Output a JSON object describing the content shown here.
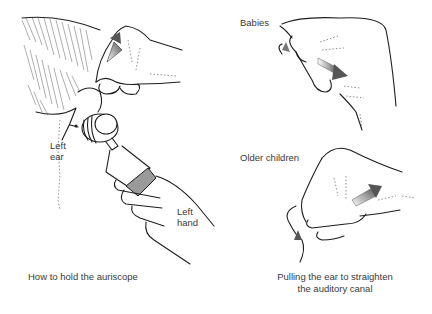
{
  "figure": {
    "left_panel": {
      "labels": {
        "ear": [
          "Left",
          "ear"
        ],
        "hand": [
          "Left",
          "hand"
        ]
      },
      "caption": "How to hold the auriscope"
    },
    "right_panel": {
      "labels": {
        "babies": "Babies",
        "older_children": "Older children"
      },
      "caption_lines": [
        "Pulling the ear to straighten",
        "the auditory canal"
      ]
    },
    "colors": {
      "line": "#1e1e1e",
      "arrow_gray": "#6b6b6b",
      "speculum_gray": "#9a9a9a",
      "text": "#3a3a3a"
    }
  }
}
